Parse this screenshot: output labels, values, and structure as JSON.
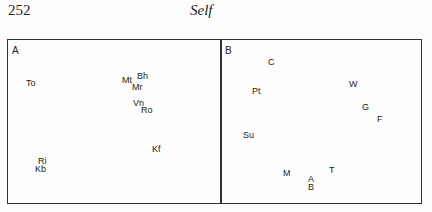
{
  "header": {
    "page_number": "252",
    "running_head": "Self"
  },
  "panels": [
    {
      "label": "A",
      "points": [
        {
          "text": "To",
          "x": 26,
          "y": 79
        },
        {
          "text": "Mt",
          "x": 122,
          "y": 76
        },
        {
          "text": "Bh",
          "x": 137,
          "y": 72
        },
        {
          "text": "Mr",
          "x": 132,
          "y": 83
        },
        {
          "text": "Vn",
          "x": 133,
          "y": 99
        },
        {
          "text": "Ro",
          "x": 141,
          "y": 106
        },
        {
          "text": "Kf",
          "x": 152,
          "y": 145
        },
        {
          "text": "Ri",
          "x": 38,
          "y": 157
        },
        {
          "text": "Kb",
          "x": 35,
          "y": 165
        }
      ]
    },
    {
      "label": "B",
      "points": [
        {
          "text": "C",
          "x": 268,
          "y": 58
        },
        {
          "text": "Pt",
          "x": 252,
          "y": 87
        },
        {
          "text": "W",
          "x": 349,
          "y": 80
        },
        {
          "text": "G",
          "x": 362,
          "y": 103
        },
        {
          "text": "F",
          "x": 377,
          "y": 115
        },
        {
          "text": "Su",
          "x": 243,
          "y": 131
        },
        {
          "text": "M",
          "x": 283,
          "y": 169
        },
        {
          "text": "T",
          "x": 329,
          "y": 166
        },
        {
          "text": "A",
          "x": 308,
          "y": 175
        },
        {
          "text": "B",
          "x": 308,
          "y": 183
        }
      ]
    }
  ],
  "chart_data": [
    {
      "type": "scatter",
      "title": "A",
      "labels": [
        "To",
        "Mt",
        "Bh",
        "Mr",
        "Vn",
        "Ro",
        "Kf",
        "Ri",
        "Kb"
      ],
      "grid": false
    },
    {
      "type": "scatter",
      "title": "B",
      "labels": [
        "C",
        "Pt",
        "W",
        "G",
        "F",
        "Su",
        "M",
        "T",
        "A",
        "B"
      ],
      "grid": false
    }
  ]
}
